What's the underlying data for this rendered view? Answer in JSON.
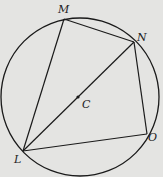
{
  "diagram": {
    "type": "circle-inscribed-quadrilateral",
    "background": "#e4e4e2",
    "stroke": "#1a1a1a",
    "circle": {
      "center_label": "C",
      "cx": 80,
      "cy": 97,
      "r": 79
    },
    "points": {
      "M": {
        "label": "M",
        "x": 64,
        "y": 19
      },
      "N": {
        "label": "N",
        "x": 134,
        "y": 42
      },
      "O": {
        "label": "O",
        "x": 147,
        "y": 134
      },
      "L": {
        "label": "L",
        "x": 23,
        "y": 151
      },
      "C": {
        "label": "C",
        "x": 78,
        "y": 97
      }
    },
    "segments": [
      "LM",
      "MN",
      "NO",
      "OL",
      "LN"
    ]
  }
}
